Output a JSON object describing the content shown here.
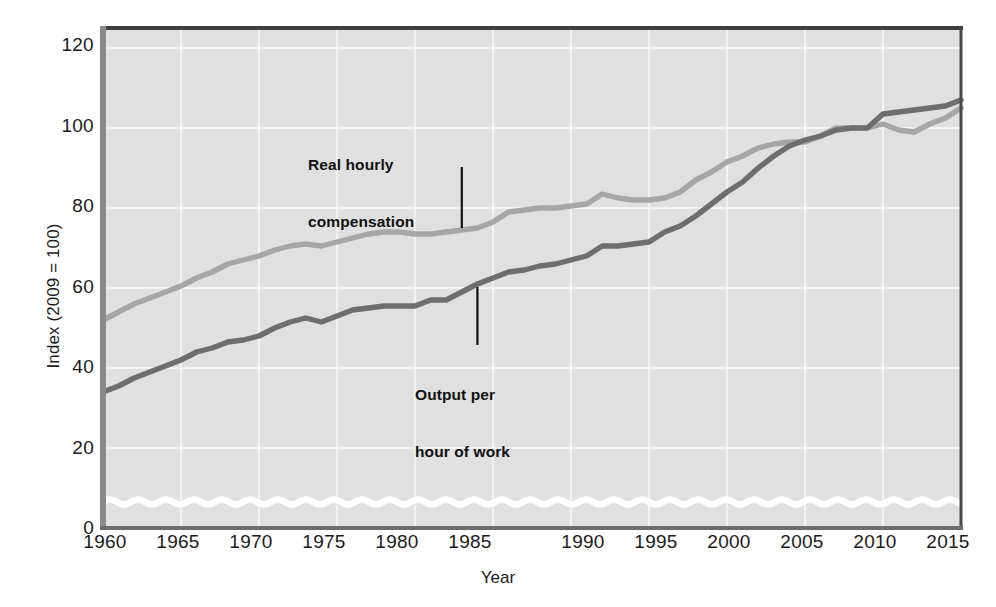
{
  "chart_data": {
    "type": "line",
    "title": "",
    "xlabel": "Year",
    "ylabel": "Index (2009 = 100)",
    "xlim": [
      1960,
      2015
    ],
    "ylim": [
      0,
      125
    ],
    "xticks": [
      1960,
      1965,
      1970,
      1975,
      1980,
      1985,
      1990,
      1995,
      2000,
      2005,
      2010,
      2015
    ],
    "yticks": [
      0,
      20,
      40,
      60,
      80,
      100,
      120
    ],
    "grid": true,
    "legend_position": "inline-annotations",
    "axis_break": true,
    "axis_break_note": "white wavy band near the baseline indicating a broken vertical axis",
    "plot_background": "#e0e0e0",
    "annotations": [
      {
        "id": "real-hourly-compensation",
        "text_line1": "Real hourly",
        "text_line2": "compensation",
        "points_to_series": "Real hourly compensation",
        "points_to_year": 1983
      },
      {
        "id": "output-per-hour-of-work",
        "text_line1": "Output per",
        "text_line2": "hour of work",
        "points_to_series": "Output per hour of work",
        "points_to_year": 1984
      }
    ],
    "x": [
      1960,
      1961,
      1962,
      1963,
      1964,
      1965,
      1966,
      1967,
      1968,
      1969,
      1970,
      1971,
      1972,
      1973,
      1974,
      1975,
      1976,
      1977,
      1978,
      1979,
      1980,
      1981,
      1982,
      1983,
      1984,
      1985,
      1986,
      1987,
      1988,
      1989,
      1990,
      1991,
      1992,
      1993,
      1994,
      1995,
      1996,
      1997,
      1998,
      1999,
      2000,
      2001,
      2002,
      2003,
      2004,
      2005,
      2006,
      2007,
      2008,
      2009,
      2010,
      2011,
      2012,
      2013,
      2014,
      2015
    ],
    "series": [
      {
        "name": "Real hourly compensation",
        "color": "#a6a6a6",
        "values": [
          52,
          54,
          56,
          57.5,
          59,
          60.5,
          62.5,
          64,
          66,
          67,
          68,
          69.5,
          70.5,
          71,
          70.5,
          71.5,
          72.5,
          73.5,
          74,
          74,
          73.5,
          73.5,
          74,
          74.5,
          75,
          76.5,
          79,
          79.5,
          80,
          80,
          80.5,
          81,
          83.5,
          82.5,
          82,
          82,
          82.5,
          84,
          87,
          89,
          91.5,
          93,
          95,
          96,
          96.5,
          96.5,
          98,
          100,
          100,
          100,
          101,
          99.5,
          99,
          101,
          102.5,
          105
        ]
      },
      {
        "name": "Output per hour of work",
        "color": "#6e6e6e",
        "values": [
          34,
          35.5,
          37.5,
          39,
          40.5,
          42,
          44,
          45,
          46.5,
          47,
          48,
          50,
          51.5,
          52.5,
          51.5,
          53,
          54.5,
          55,
          55.5,
          55.5,
          55.5,
          57,
          57,
          59,
          61,
          62.5,
          64,
          64.5,
          65.5,
          66,
          67,
          68,
          70.5,
          70.5,
          71,
          71.5,
          74,
          75.5,
          78,
          81,
          84,
          86.5,
          90,
          93,
          95.5,
          97,
          98,
          99.5,
          100,
          100,
          103.5,
          104,
          104.5,
          105,
          105.5,
          107
        ]
      }
    ]
  },
  "axis": {
    "ylabel": "Index (2009 = 100)",
    "xlabel": "Year",
    "ytick_labels": [
      "0",
      "20",
      "40",
      "60",
      "80",
      "100",
      "120"
    ],
    "xtick_labels": [
      "1960",
      "1965",
      "1970",
      "1975",
      "1980",
      "1985",
      "1990",
      "1995",
      "2000",
      "2005",
      "2010",
      "2015"
    ]
  },
  "annotations": {
    "compensation": {
      "line1": "Real hourly",
      "line2": "compensation"
    },
    "output": {
      "line1": "Output per",
      "line2": "hour of work"
    }
  },
  "colors": {
    "compensation_line": "#a6a6a6",
    "output_line": "#6e6e6e",
    "plot_background": "#e0e0e0",
    "frame": "#5a5a5a",
    "gridline": "#f2f2f2",
    "text": "#1b1b1b",
    "axis_break": "#ffffff"
  }
}
